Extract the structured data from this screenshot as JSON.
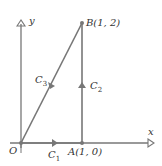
{
  "diagram": {
    "axes": {
      "x_label": "x",
      "y_label": "y"
    },
    "points": {
      "origin": {
        "name": "O"
      },
      "A": {
        "label": "A(1, 0)",
        "coords": [
          1,
          0
        ]
      },
      "B": {
        "label": "B(1, 2)",
        "coords": [
          1,
          2
        ]
      }
    },
    "curves": [
      {
        "name": "C",
        "sub": "1",
        "from": "O",
        "to": "A"
      },
      {
        "name": "C",
        "sub": "2",
        "from": "A",
        "to": "B"
      },
      {
        "name": "C",
        "sub": "3",
        "from": "B",
        "to": "O"
      }
    ],
    "colors": {
      "line": "#777777",
      "text": "#333333"
    }
  }
}
